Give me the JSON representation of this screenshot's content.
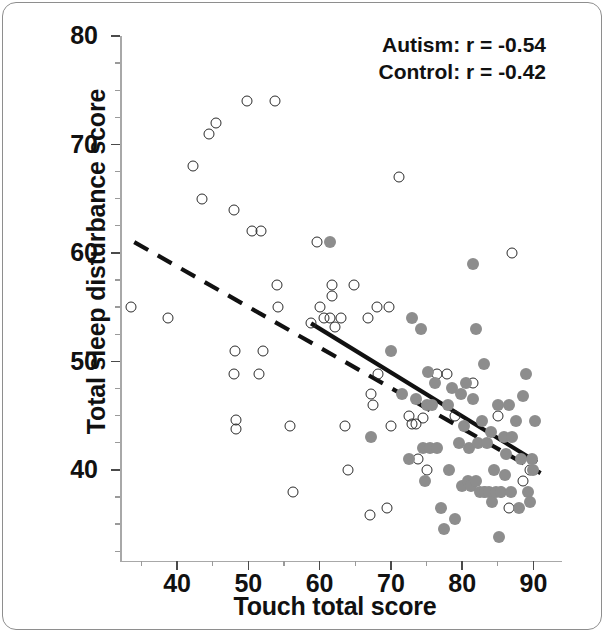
{
  "chart_data": {
    "type": "scatter",
    "title": "",
    "xlabel": "Touch total score",
    "ylabel": "Total sleep disturbance score",
    "xlim": [
      32,
      94
    ],
    "ylim": [
      31.5,
      80
    ],
    "xticks": [
      40,
      50,
      60,
      70,
      80,
      90
    ],
    "yticks": [
      40,
      50,
      60,
      70,
      80
    ],
    "x_minor_step": 5,
    "y_minor_step": 2.5,
    "grid": false,
    "legend_position": "top-right",
    "annotations": [
      "Autism: r = -0.54",
      "Control: r = -0.42"
    ],
    "series": [
      {
        "name": "Control",
        "marker": "open-circle",
        "color": "#2b2b2b",
        "correlation": -0.42,
        "trendline": {
          "style": "dashed",
          "x": [
            34,
            91
          ],
          "y": [
            61.0,
            39.7
          ]
        },
        "points": [
          [
            33.5,
            55.0
          ],
          [
            38.8,
            54.0
          ],
          [
            42.2,
            68.0
          ],
          [
            43.5,
            65.0
          ],
          [
            44.5,
            71.0
          ],
          [
            45.5,
            72.0
          ],
          [
            48.0,
            64.0
          ],
          [
            48.0,
            48.8
          ],
          [
            48.2,
            51.0
          ],
          [
            48.3,
            44.6
          ],
          [
            48.3,
            43.8
          ],
          [
            49.8,
            74.0
          ],
          [
            50.5,
            62.0
          ],
          [
            51.5,
            48.8
          ],
          [
            51.8,
            62.0
          ],
          [
            52.0,
            51.0
          ],
          [
            53.8,
            74.0
          ],
          [
            54.0,
            57.0
          ],
          [
            54.2,
            55.0
          ],
          [
            55.8,
            44.0
          ],
          [
            56.2,
            38.0
          ],
          [
            58.8,
            53.5
          ],
          [
            59.6,
            61.0
          ],
          [
            60.0,
            55.0
          ],
          [
            60.6,
            54.0
          ],
          [
            61.5,
            54.0
          ],
          [
            61.8,
            57.0
          ],
          [
            61.8,
            56.0
          ],
          [
            62.2,
            53.2
          ],
          [
            63.0,
            54.0
          ],
          [
            63.5,
            44.0
          ],
          [
            64.0,
            40.0
          ],
          [
            64.8,
            57.0
          ],
          [
            66.8,
            54.0
          ],
          [
            67.0,
            35.8
          ],
          [
            67.2,
            47.0
          ],
          [
            67.5,
            46.0
          ],
          [
            68.0,
            55.0
          ],
          [
            68.2,
            48.8
          ],
          [
            69.5,
            36.5
          ],
          [
            69.8,
            55.0
          ],
          [
            70.0,
            44.0
          ],
          [
            71.2,
            67.0
          ],
          [
            72.5,
            45.0
          ],
          [
            73.0,
            44.2
          ],
          [
            73.5,
            44.2
          ],
          [
            73.8,
            41.0
          ],
          [
            74.5,
            44.8
          ],
          [
            75.0,
            40.0
          ],
          [
            76.5,
            48.8
          ],
          [
            77.8,
            48.8
          ],
          [
            79.0,
            45.0
          ],
          [
            81.5,
            48.0
          ],
          [
            83.0,
            38.0
          ],
          [
            85.0,
            45.0
          ],
          [
            85.5,
            38.0
          ],
          [
            86.5,
            36.5
          ],
          [
            87.0,
            60.0
          ],
          [
            88.5,
            39.0
          ],
          [
            89.5,
            40.0
          ]
        ]
      },
      {
        "name": "Autism",
        "marker": "filled-circle",
        "color": "#8d8d8d",
        "correlation": -0.54,
        "trendline": {
          "style": "solid",
          "x": [
            58.8,
            90.5
          ],
          "y": [
            53.5,
            40.7
          ]
        },
        "points": [
          [
            61.4,
            61.0
          ],
          [
            67.2,
            43.0
          ],
          [
            70.0,
            51.0
          ],
          [
            72.5,
            41.0
          ],
          [
            73.0,
            54.0
          ],
          [
            73.5,
            46.5
          ],
          [
            74.2,
            53.0
          ],
          [
            74.5,
            42.0
          ],
          [
            74.8,
            39.0
          ],
          [
            75.0,
            46.0
          ],
          [
            75.5,
            42.0
          ],
          [
            75.8,
            46.0
          ],
          [
            76.2,
            48.0
          ],
          [
            76.5,
            42.0
          ],
          [
            77.0,
            36.5
          ],
          [
            77.5,
            34.5
          ],
          [
            78.0,
            46.0
          ],
          [
            78.2,
            40.0
          ],
          [
            78.5,
            47.5
          ],
          [
            79.0,
            35.5
          ],
          [
            79.5,
            42.5
          ],
          [
            79.8,
            47.0
          ],
          [
            80.0,
            38.5
          ],
          [
            80.2,
            44.0
          ],
          [
            80.5,
            48.0
          ],
          [
            80.8,
            39.0
          ],
          [
            81.0,
            42.0
          ],
          [
            81.2,
            38.5
          ],
          [
            81.5,
            59.0
          ],
          [
            81.5,
            46.5
          ],
          [
            82.0,
            53.0
          ],
          [
            82.0,
            39.0
          ],
          [
            82.2,
            42.5
          ],
          [
            82.5,
            38.0
          ],
          [
            82.8,
            44.5
          ],
          [
            83.0,
            49.8
          ],
          [
            83.2,
            38.0
          ],
          [
            83.5,
            42.5
          ],
          [
            83.8,
            38.0
          ],
          [
            84.0,
            43.5
          ],
          [
            84.2,
            37.0
          ],
          [
            84.5,
            40.0
          ],
          [
            84.8,
            38.0
          ],
          [
            85.0,
            46.0
          ],
          [
            85.2,
            33.8
          ],
          [
            85.5,
            38.0
          ],
          [
            85.8,
            43.0
          ],
          [
            86.0,
            39.5
          ],
          [
            86.2,
            41.5
          ],
          [
            86.5,
            46.0
          ],
          [
            86.8,
            38.0
          ],
          [
            87.0,
            43.0
          ],
          [
            87.5,
            44.5
          ],
          [
            88.0,
            36.5
          ],
          [
            88.2,
            41.0
          ],
          [
            88.5,
            46.8
          ],
          [
            89.0,
            48.8
          ],
          [
            89.2,
            38.0
          ],
          [
            89.5,
            37.0
          ],
          [
            89.8,
            41.0
          ],
          [
            90.0,
            40.0
          ],
          [
            90.2,
            44.5
          ],
          [
            75.2,
            49.0
          ],
          [
            71.5,
            47.0
          ]
        ]
      }
    ]
  },
  "axes": {
    "x_tick_labels": [
      "40",
      "50",
      "60",
      "70",
      "80",
      "90"
    ],
    "y_tick_labels": [
      "80",
      "70",
      "60",
      "50",
      "40"
    ],
    "x_title": "Touch total score",
    "y_title": "Total sleep disturbance score"
  },
  "legend": {
    "line1": "Autism: r = -0.54",
    "line2": "Control: r = -0.42"
  },
  "colors": {
    "autism_marker": "#8d8d8d",
    "control_marker": "#2b2b2b",
    "axis": "#a8a8a8",
    "text": "#111111",
    "frame": "#8e8e8e"
  }
}
